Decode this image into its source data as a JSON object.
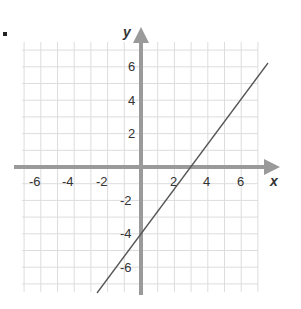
{
  "chart_data": {
    "type": "line",
    "title": "",
    "xlabel": "x",
    "ylabel": "y",
    "xlim": [
      -7,
      7
    ],
    "ylim": [
      -7.5,
      7.5
    ],
    "grid": true,
    "x_ticks": [
      "-6",
      "-4",
      "-2",
      "2",
      "4",
      "6"
    ],
    "y_ticks": [
      "6",
      "4",
      "2",
      "-2",
      "-4",
      "-6"
    ],
    "series": [
      {
        "name": "line",
        "equation": "y = (4/3)x - 4",
        "x": [
          -2.6,
          0,
          3,
          7.6
        ],
        "y": [
          -7.5,
          -4,
          0,
          6.2
        ]
      }
    ],
    "colors": {
      "grid": "#dddddd",
      "axis": "#9a9a9a",
      "line": "#555555"
    }
  }
}
